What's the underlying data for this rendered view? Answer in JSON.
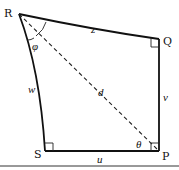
{
  "diagram": {
    "vertices": {
      "R": {
        "label": "R"
      },
      "Q": {
        "label": "Q"
      },
      "P": {
        "label": "P"
      },
      "S": {
        "label": "S"
      }
    },
    "edges": {
      "z": {
        "label": "z",
        "from": "R",
        "to": "Q",
        "style": "curved"
      },
      "v": {
        "label": "v",
        "from": "Q",
        "to": "P",
        "style": "straight"
      },
      "u": {
        "label": "u",
        "from": "S",
        "to": "P",
        "style": "straight"
      },
      "w": {
        "label": "w",
        "from": "R",
        "to": "S",
        "style": "curved"
      },
      "d": {
        "label": "d",
        "from": "R",
        "to": "P",
        "style": "dashed"
      }
    },
    "angles": {
      "phi": {
        "label": "φ",
        "at": "R"
      },
      "theta": {
        "label": "θ",
        "at": "P"
      }
    },
    "right_angles": [
      "Q",
      "P",
      "S"
    ],
    "colors": {
      "ink": "#111111",
      "background": "#ffffff"
    }
  }
}
